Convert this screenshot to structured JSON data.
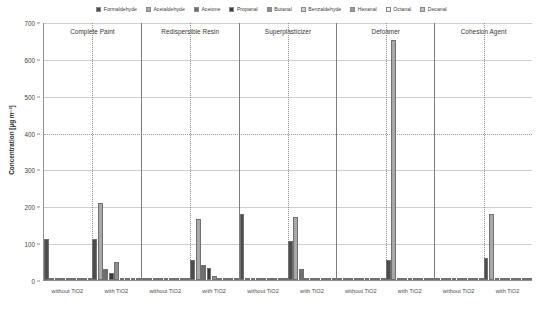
{
  "chart_data": {
    "type": "bar",
    "title": "",
    "xlabel": "",
    "ylabel": "Concentration [µg m⁻³]",
    "ylim": [
      0,
      700
    ],
    "yticks": [
      0,
      100,
      200,
      300,
      400,
      500,
      600,
      700
    ],
    "grid": true,
    "legend_position": "top-center",
    "series": [
      {
        "name": "Formaldehyde",
        "color": "#4d4d4d",
        "values": [
          110,
          110,
          0,
          55,
          180,
          105,
          2,
          55,
          1,
          60
        ]
      },
      {
        "name": "Acetaldehyde",
        "color": "#a8a8a8",
        "values": [
          3,
          210,
          4,
          165,
          4,
          170,
          1,
          650,
          1,
          180
        ]
      },
      {
        "name": "Acetone",
        "color": "#6e6e6e",
        "values": [
          1,
          30,
          3,
          40,
          2,
          30,
          1,
          3,
          1,
          3
        ]
      },
      {
        "name": "Propanal",
        "color": "#3a3a3a",
        "values": [
          0,
          20,
          1,
          33,
          1,
          5,
          0,
          2,
          0,
          2
        ]
      },
      {
        "name": "Butanal",
        "color": "#8f8f8f",
        "values": [
          0,
          50,
          1,
          10,
          1,
          3,
          0,
          2,
          0,
          2
        ]
      },
      {
        "name": "Benzaldehyde",
        "color": "#d2d2d2",
        "values": [
          0,
          3,
          1,
          3,
          1,
          2,
          0,
          1,
          0,
          1
        ]
      },
      {
        "name": "Hexanal",
        "color": "#9b9b9b",
        "values": [
          0,
          2,
          1,
          2,
          1,
          2,
          0,
          1,
          0,
          1
        ]
      },
      {
        "name": "Octanal",
        "color": "#efefef",
        "values": [
          0,
          1,
          1,
          1,
          1,
          1,
          0,
          1,
          0,
          1
        ]
      },
      {
        "name": "Decanal",
        "color": "#c0c0c0",
        "values": [
          0,
          2,
          1,
          2,
          1,
          2,
          0,
          1,
          0,
          1
        ]
      }
    ],
    "categories": [
      "without TiO2",
      "with TiO2",
      "without TiO2",
      "with TiO2",
      "without TiO2",
      "with TiO2",
      "without TiO2",
      "with TiO2",
      "without TiO2",
      "with TiO2"
    ],
    "panels": [
      {
        "title": "Complete Paint",
        "groups": [
          "without TiO2",
          "with TiO2"
        ]
      },
      {
        "title": "Redispersible Resin",
        "groups": [
          "without TiO2",
          "with TiO2"
        ]
      },
      {
        "title": "Superplasticizer",
        "groups": [
          "without TiO2",
          "with TiO2"
        ]
      },
      {
        "title": "Defoamer",
        "groups": [
          "without TiO2",
          "with TiO2"
        ]
      },
      {
        "title": "Cohesion Agent",
        "groups": [
          "without TiO2",
          "with TiO2"
        ]
      }
    ]
  },
  "legend": {
    "items": [
      {
        "label": "Formaldehyde"
      },
      {
        "label": "Acetaldehyde"
      },
      {
        "label": "Acetone"
      },
      {
        "label": "Propanal"
      },
      {
        "label": "Butanal"
      },
      {
        "label": "Benzaldehyde"
      },
      {
        "label": "Hexanal"
      },
      {
        "label": "Octanal"
      },
      {
        "label": "Decanal"
      }
    ]
  },
  "axes": {
    "y_title": "Concentration [µg m⁻³]"
  }
}
